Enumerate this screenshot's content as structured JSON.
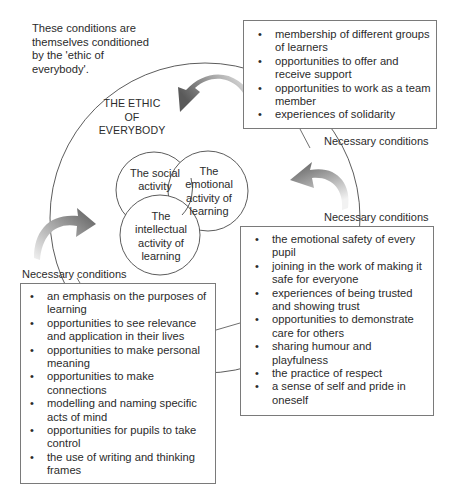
{
  "intro_note": "These conditions are themselves conditioned by the 'ethic of everybody'.",
  "outer_circle": {
    "title_lines": [
      "THE ETHIC",
      "OF",
      "EVERYBODY"
    ]
  },
  "inner_circles": {
    "social": "The social activity",
    "emotional": "The emotional activity of learning",
    "intellectual": "The intellectual activity of learning"
  },
  "condition_labels": {
    "top": "Necessary conditions",
    "right": "Necessary conditions",
    "left": "Necessary conditions"
  },
  "boxes": {
    "social_conditions": [
      "membership of different groups of learners",
      "opportunities to offer and receive support",
      "opportunities to work as a team member",
      "experiences of solidarity"
    ],
    "emotional_conditions": [
      "the emotional safety of every pupil",
      "joining in the work of making it safe for everyone",
      "experiences of being trusted and showing trust",
      "opportunities to demonstrate care for others",
      "sharing humour and playfulness",
      "the practice of respect",
      "a sense of self and pride in oneself"
    ],
    "intellectual_conditions": [
      "an emphasis on the purposes of learning",
      "opportunities to see relevance and application in their lives",
      "opportunities to make personal meaning",
      "opportunities to make connections",
      "modelling and naming specific acts of mind",
      "opportunities for pupils to take control",
      "the use of writing and thinking frames"
    ]
  },
  "icons": {
    "bullet": "•",
    "arrows": [
      "curved-arrow-top",
      "curved-arrow-right",
      "curved-arrow-left"
    ]
  },
  "colors": {
    "line": "#4a4a4a",
    "box_border": "#7a7a7a",
    "arrow_dark": "#555555",
    "arrow_light": "#e6e6e6",
    "text": "#2b2b2b"
  }
}
